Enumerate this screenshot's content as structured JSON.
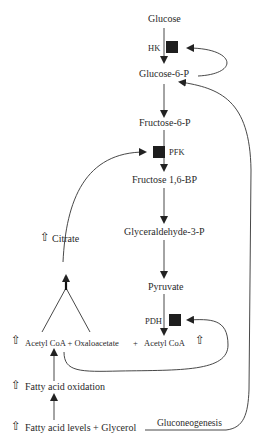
{
  "diagram": {
    "type": "metabolic-pathway",
    "nodes": {
      "glucose": "Glucose",
      "glucose6p": "Glucose-6-P",
      "fructose6p": "Fructose-6-P",
      "fructose16bp": "Fructose 1,6-BP",
      "g3p": "Glyceraldehyde-3-P",
      "pyruvate": "Pyruvate",
      "citrate": "Citrate",
      "acetyl_line_left": "Acetyl CoA + Oxaloacetate",
      "acetyl_plus": "+",
      "acetyl_right": "Acetyl CoA",
      "fa_oxidation": "Fatty acid oxidation",
      "fa_levels": "Fatty acid levels + Glycerol",
      "gluconeogenesis": "Gluconeogenesis"
    },
    "enzymes": {
      "hk": "HK",
      "pfk": "PFK",
      "pdh": "PDH"
    },
    "indicators": {
      "up_arrow_glyph": "⇧"
    },
    "colors": {
      "line": "#333333",
      "enzyme_box": "#1e1e1e",
      "text": "#2a2a2a"
    }
  }
}
